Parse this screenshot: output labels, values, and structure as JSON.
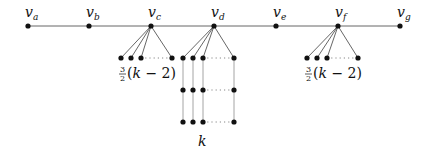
{
  "diagram": {
    "spine": {
      "y": 26,
      "vertices": [
        {
          "id": "va",
          "name": "v",
          "sub": "a",
          "x": 28
        },
        {
          "id": "vb",
          "name": "v",
          "sub": "b",
          "x": 89
        },
        {
          "id": "vc",
          "name": "v",
          "sub": "c",
          "x": 151
        },
        {
          "id": "vd",
          "name": "v",
          "sub": "d",
          "x": 214
        },
        {
          "id": "ve",
          "name": "v",
          "sub": "e",
          "x": 276
        },
        {
          "id": "vf",
          "name": "v",
          "sub": "f",
          "x": 338
        },
        {
          "id": "vg",
          "name": "v",
          "sub": "g",
          "x": 400
        }
      ]
    },
    "stars": [
      {
        "parent": "vc",
        "parent_x": 151,
        "leaf_y": 58,
        "leaves_x": [
          121,
          131,
          141,
          172
        ],
        "dotted_from": 141,
        "dotted_to": 172,
        "label": {
          "num": "3",
          "den": "2",
          "expr_open": "(",
          "var": "k",
          "rest": " − 2)",
          "x": 118,
          "y": 78
        }
      },
      {
        "parent": "vf",
        "parent_x": 338,
        "leaf_y": 58,
        "leaves_x": [
          307,
          317,
          327,
          358
        ],
        "dotted_from": 327,
        "dotted_to": 358,
        "label": {
          "num": "3",
          "den": "2",
          "expr_open": "(",
          "var": "k",
          "rest": " − 2)",
          "x": 304,
          "y": 78
        }
      }
    ],
    "grid": {
      "parent": "vd",
      "parent_x": 214,
      "columns_x": [
        183,
        193,
        203,
        234
      ],
      "rows_y": [
        58,
        90,
        122
      ],
      "dotted_from": 203,
      "dotted_to": 234,
      "label": "k",
      "label_x": 198,
      "label_y": 146
    },
    "colors": {
      "edge": "#555555",
      "node": "#111111"
    }
  }
}
